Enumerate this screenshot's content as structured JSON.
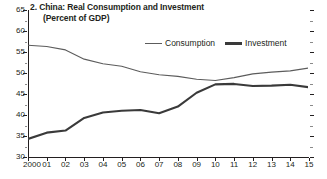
{
  "chart_data": {
    "type": "line",
    "title": "2. China: Real Consumption and Investment",
    "subtitle": "(Percent of GDP)",
    "xlabel": "",
    "ylabel": "",
    "ylim": [
      30,
      65
    ],
    "ytick_values": [
      30,
      35,
      40,
      45,
      50,
      55,
      60,
      65
    ],
    "ytick_labels": [
      "30",
      "35",
      "40",
      "45",
      "50",
      "55",
      "60",
      "65"
    ],
    "yminor_step": 2.5,
    "xlim": [
      2000,
      2015
    ],
    "x": [
      2000,
      2001,
      2002,
      2003,
      2004,
      2005,
      2006,
      2007,
      2008,
      2009,
      2010,
      2011,
      2012,
      2013,
      2014,
      2015
    ],
    "xtick_labels": [
      "2000",
      "01",
      "02",
      "03",
      "04",
      "05",
      "06",
      "07",
      "08",
      "09",
      "10",
      "11",
      "12",
      "13",
      "14",
      "15"
    ],
    "grid": false,
    "legend_position": "top-right-inside",
    "series": [
      {
        "name": "Consumption",
        "color": "#5c5c5c",
        "width": 1.1,
        "values": [
          56.6,
          56.3,
          55.5,
          53.3,
          52.2,
          51.6,
          50.3,
          49.6,
          49.2,
          48.5,
          48.2,
          48.9,
          49.8,
          50.2,
          50.5,
          51.2
        ]
      },
      {
        "name": "Investment",
        "color": "#3a3a3a",
        "width": 2.1,
        "values": [
          34.3,
          35.8,
          36.3,
          39.3,
          40.6,
          41.0,
          41.2,
          40.4,
          42.0,
          45.3,
          47.3,
          47.4,
          46.9,
          47.0,
          47.2,
          46.6
        ]
      }
    ]
  }
}
